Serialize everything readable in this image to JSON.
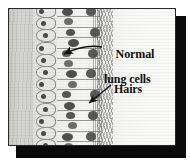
{
  "figure": {
    "type": "histology-micrograph",
    "frame": {
      "border_color": "#2a2a2a",
      "shadow_color": "#0a0a0a",
      "plate_color": "#f2f2f0"
    },
    "background_color": "#ffffff"
  },
  "labels": {
    "normal_cells": {
      "line1": "Normal",
      "line2": "lung cells",
      "pointer": "curved-arrow-left"
    },
    "hairs": {
      "text": "Hairs",
      "pointer": "straight-arrow-down-left"
    }
  },
  "regions": {
    "submucosa": "submucosa-band",
    "basal_layer": "basal-cell-layer",
    "columnar_layer": "columnar-epithelial-cells",
    "cilia": "ciliated-fringe",
    "lumen": "airway-lumen"
  },
  "colors": {
    "tissue_light": "#f4f4f2",
    "tissue_grey": "#cfcfcc",
    "nucleus": "#565654",
    "cell_outline": "#8d8d8a",
    "label_text": "#111111"
  }
}
